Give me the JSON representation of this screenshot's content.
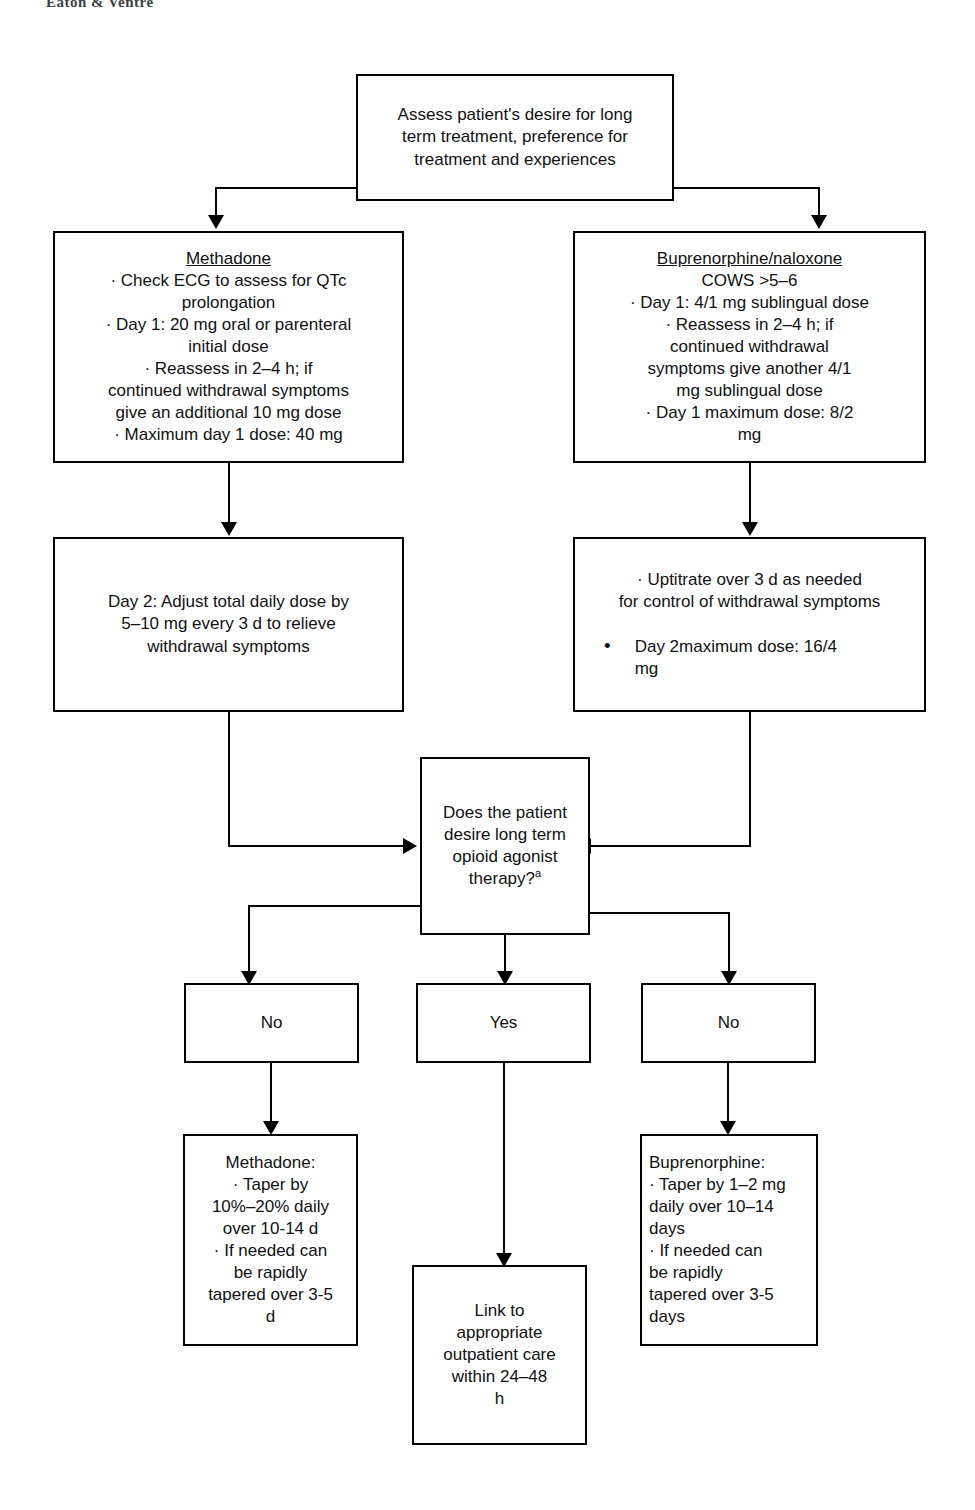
{
  "page": {
    "running_head": "Eaton & Ventre"
  },
  "flowchart": {
    "type": "flowchart",
    "title": "Opioid use disorder treatment initiation and taper algorithm",
    "nodes": {
      "assess": {
        "id": "assess",
        "shape": "rect",
        "lines": [
          "Assess patient's desire for long",
          "term   treatment, preference for",
          "treatment and experiences"
        ]
      },
      "methadone_init": {
        "id": "methadone-initiation",
        "shape": "rect",
        "heading": "Methadone",
        "heading_underlined": true,
        "lines": [
          "· Check ECG to assess for QTc",
          "prolongation",
          "· Day 1: 20 mg oral or parenteral",
          "initial dose",
          "· Reassess in 2–4 h; if",
          "continued withdrawal symptoms",
          "give an additional 10 mg dose",
          "· Maximum day 1 dose: 40 mg"
        ]
      },
      "bup_init": {
        "id": "buprenorphine-initiation",
        "shape": "rect",
        "heading": "Buprenorphine/naloxone",
        "heading_underlined": true,
        "lines": [
          "COWS >5–6",
          "· Day 1: 4/1 mg sublingual dose",
          "· Reassess in 2–4 h; if",
          "continued withdrawal",
          "symptoms give another 4/1",
          "mg sublingual dose",
          "· Day 1 maximum dose: 8/2",
          "mg"
        ]
      },
      "methadone_day2": {
        "id": "methadone-day-2",
        "shape": "rect",
        "lines": [
          "Day 2: Adjust total daily dose by",
          "5–10 mg every 3 d to relieve",
          "withdrawal symptoms"
        ]
      },
      "bup_day2": {
        "id": "buprenorphine-day-2",
        "shape": "rect",
        "lines_top": [
          "· Uptitrate over 3 d as needed",
          "for control of withdrawal symptoms"
        ],
        "bullet_glyph": "•",
        "lines_bullet": [
          "Day 2maximum dose: 16/4",
          "mg"
        ]
      },
      "decision": {
        "id": "desire-long-term-therapy",
        "shape": "rect",
        "lines": [
          "Does the patient",
          "desire long term",
          "opioid agonist",
          "therapy?"
        ],
        "superscript": "a"
      },
      "no_left": {
        "id": "answer-no-left",
        "label": "No"
      },
      "yes_center": {
        "id": "answer-yes",
        "label": "Yes"
      },
      "no_right": {
        "id": "answer-no-right",
        "label": "No"
      },
      "methadone_taper": {
        "id": "methadone-taper",
        "shape": "rect",
        "lines": [
          "Methadone:",
          "· Taper by",
          "10%–20% daily",
          "over 10-14 d",
          "· If needed can",
          "be rapidly",
          "tapered over 3-5",
          "d"
        ]
      },
      "link_care": {
        "id": "link-to-outpatient-care",
        "shape": "rect",
        "lines": [
          "Link to",
          "appropriate",
          "outpatient care",
          "within 24–48",
          "h"
        ]
      },
      "bup_taper": {
        "id": "buprenorphine-taper",
        "shape": "rect",
        "lines": [
          "Buprenorphine:",
          "· Taper by 1–2 mg",
          "daily over 10–14",
          "days",
          "· If needed can",
          "be rapidly",
          "tapered over 3-5",
          "days"
        ]
      }
    },
    "edges": [
      {
        "from": "assess",
        "to": "methadone_init",
        "style": "elbow-left"
      },
      {
        "from": "assess",
        "to": "bup_init",
        "style": "elbow-right"
      },
      {
        "from": "methadone_init",
        "to": "methadone_day2",
        "style": "straight-down"
      },
      {
        "from": "bup_init",
        "to": "bup_day2",
        "style": "straight-down"
      },
      {
        "from": "methadone_day2",
        "to": "decision",
        "style": "elbow-into-left-side"
      },
      {
        "from": "bup_day2",
        "to": "decision",
        "style": "elbow-into-right-side"
      },
      {
        "from": "decision",
        "to": "no_left",
        "style": "elbow-left"
      },
      {
        "from": "decision",
        "to": "yes_center",
        "style": "straight-down"
      },
      {
        "from": "decision",
        "to": "no_right",
        "style": "elbow-right"
      },
      {
        "from": "no_left",
        "to": "methadone_taper",
        "style": "straight-down"
      },
      {
        "from": "yes_center",
        "to": "link_care",
        "style": "straight-down"
      },
      {
        "from": "no_right",
        "to": "bup_taper",
        "style": "straight-down"
      }
    ],
    "colors": {
      "line": "#000000",
      "box_fill": "#ffffff",
      "text": "#111111"
    }
  }
}
